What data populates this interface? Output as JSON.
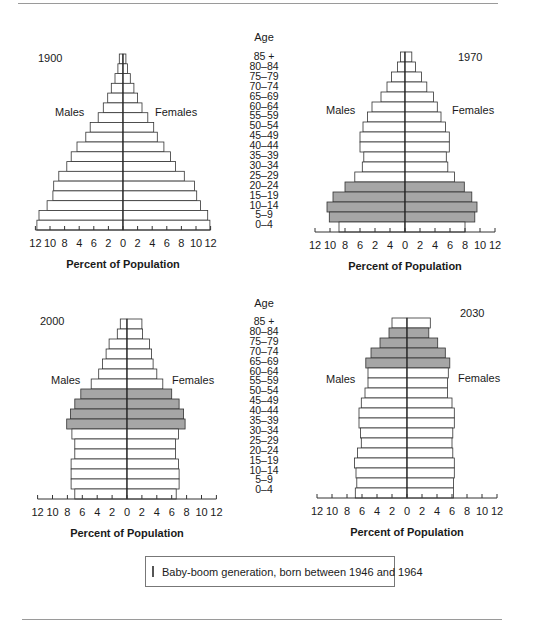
{
  "age_header": "Age",
  "age_groups": [
    "85 +",
    "80–84",
    "75–79",
    "70–74",
    "65–69",
    "60–64",
    "55–59",
    "50–54",
    "45–49",
    "40–44",
    "35–39",
    "30–34",
    "25–29",
    "20–24",
    "15–19",
    "10–14",
    "5–9",
    "0–4"
  ],
  "legend": {
    "label": "Baby-boom generation, born between 1946 and 1964",
    "color": "#a6a6a6"
  },
  "colors": {
    "bar_fill": "#ffffff",
    "boom_fill": "#a6a6a6",
    "stroke": "#333333"
  },
  "chart_data": [
    {
      "type": "bar",
      "title": "1900",
      "xlabel": "Percent of Population",
      "left_label": "Males",
      "right_label": "Females",
      "tick_labels": [
        "12",
        "10",
        "8",
        "4",
        "6",
        "2",
        "0",
        "2",
        "4",
        "6",
        "8",
        "10",
        "12"
      ],
      "xlim": [
        -12,
        12
      ],
      "categories": [
        "85 +",
        "80–84",
        "75–79",
        "70–74",
        "65–69",
        "60–64",
        "55–59",
        "50–54",
        "45–49",
        "40–44",
        "35–39",
        "30–34",
        "25–29",
        "20–24",
        "15–19",
        "10–14",
        "5–9",
        "0–4"
      ],
      "series": [
        {
          "name": "Males",
          "values": [
            0.5,
            0.7,
            1.1,
            1.6,
            2.1,
            2.7,
            3.4,
            4.5,
            5.1,
            6.3,
            7.1,
            7.7,
            8.8,
            9.5,
            9.6,
            10.4,
            11.5,
            11.8
          ]
        },
        {
          "name": "Females",
          "values": [
            0.4,
            0.6,
            1.0,
            1.5,
            2.0,
            2.6,
            3.4,
            4.2,
            4.7,
            5.6,
            6.5,
            7.2,
            8.4,
            9.8,
            10.1,
            10.6,
            11.6,
            11.9
          ]
        }
      ],
      "boom_rows": []
    },
    {
      "type": "bar",
      "title": "1970",
      "xlabel": "Percent of Population",
      "left_label": "Males",
      "right_label": "Females",
      "tick_labels": [
        "12",
        "10",
        "8",
        "6",
        "2",
        "4",
        "0",
        "2",
        "4",
        "6",
        "8",
        "10",
        "12"
      ],
      "xlim": [
        -12,
        12
      ],
      "categories": [
        "85 +",
        "80–84",
        "75–79",
        "70–74",
        "65–69",
        "60–64",
        "55–59",
        "50–54",
        "45–49",
        "40–44",
        "35–39",
        "30–34",
        "25–29",
        "20–24",
        "15–19",
        "10–14",
        "5–9",
        "0–4"
      ],
      "series": [
        {
          "name": "Males",
          "values": [
            0.6,
            1.0,
            1.8,
            2.4,
            3.2,
            4.4,
            5.0,
            5.6,
            6.0,
            6.0,
            5.5,
            5.7,
            6.7,
            8.0,
            9.6,
            10.4,
            10.1,
            8.8
          ]
        },
        {
          "name": "Females",
          "values": [
            0.9,
            1.4,
            2.2,
            2.9,
            3.8,
            4.3,
            4.8,
            5.4,
            5.9,
            5.9,
            5.5,
            5.7,
            6.6,
            7.9,
            8.9,
            9.6,
            9.3,
            8.0
          ]
        }
      ],
      "boom_rows": [
        "20–24",
        "15–19",
        "10–14",
        "5–9"
      ]
    },
    {
      "type": "bar",
      "title": "2000",
      "xlabel": "Percent of Population",
      "left_label": "Males",
      "right_label": "Females",
      "tick_labels": [
        "12",
        "10",
        "8",
        "6",
        "4",
        "2",
        "0",
        "2",
        "4",
        "6",
        "8",
        "10",
        "12"
      ],
      "xlim": [
        -12,
        12
      ],
      "categories": [
        "85 +",
        "80–84",
        "75–79",
        "70–74",
        "65–69",
        "60–64",
        "55–59",
        "50–54",
        "45–49",
        "40–44",
        "35–39",
        "30–34",
        "25–29",
        "20–24",
        "15–19",
        "10–14",
        "5–9",
        "0–4"
      ],
      "series": [
        {
          "name": "Males",
          "values": [
            0.9,
            1.3,
            2.4,
            2.8,
            3.3,
            3.8,
            4.8,
            6.2,
            7.0,
            7.6,
            8.1,
            7.4,
            7.0,
            7.0,
            7.5,
            7.5,
            7.5,
            7.0
          ]
        },
        {
          "name": "Females",
          "values": [
            2.0,
            2.1,
            3.0,
            3.3,
            3.5,
            4.0,
            4.8,
            6.0,
            7.0,
            7.6,
            7.8,
            6.9,
            6.5,
            6.5,
            6.9,
            7.0,
            7.0,
            6.6
          ]
        }
      ],
      "boom_rows": [
        "50–54",
        "45–49",
        "40–44",
        "35–39"
      ]
    },
    {
      "type": "bar",
      "title": "2030",
      "xlabel": "Percent of Population",
      "left_label": "Males",
      "right_label": "Females",
      "tick_labels": [
        "12",
        "10",
        "8",
        "6",
        "4",
        "2",
        "0",
        "2",
        "4",
        "6",
        "8",
        "10",
        "12"
      ],
      "xlim": [
        -12,
        12
      ],
      "categories": [
        "85 +",
        "80–84",
        "75–79",
        "70–74",
        "65–69",
        "60–64",
        "55–59",
        "50–54",
        "45–49",
        "40–44",
        "35–39",
        "30–34",
        "25–29",
        "20–24",
        "15–19",
        "10–14",
        "5–9",
        "0–4"
      ],
      "series": [
        {
          "name": "Males",
          "values": [
            2.0,
            2.4,
            3.6,
            4.8,
            5.5,
            5.2,
            5.2,
            5.6,
            6.1,
            6.4,
            6.4,
            6.2,
            6.1,
            6.6,
            7.0,
            6.8,
            6.7,
            6.9
          ]
        },
        {
          "name": "Females",
          "values": [
            3.1,
            2.9,
            4.1,
            5.1,
            5.7,
            5.5,
            5.4,
            5.4,
            6.0,
            6.3,
            6.3,
            6.1,
            6.0,
            6.1,
            6.3,
            6.3,
            6.2,
            6.2
          ]
        }
      ],
      "boom_rows": [
        "80–84",
        "75–79",
        "70–74",
        "65–69"
      ]
    }
  ]
}
